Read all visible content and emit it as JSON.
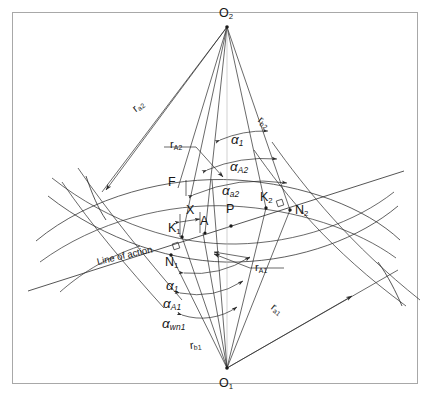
{
  "figure": {
    "type": "engineering-diagram",
    "background_color": "#ffffff",
    "line_color": "#2a2a2a",
    "border_color": "#a8a8a8"
  },
  "centers": {
    "upper": {
      "label": "O",
      "sub": "2",
      "x": 227,
      "y": 24
    },
    "lower": {
      "label": "O",
      "sub": "1",
      "x": 227,
      "y": 371
    }
  },
  "points": [
    {
      "name": "K1",
      "label": "K",
      "sub": "1",
      "x": 182,
      "y": 235
    },
    {
      "name": "A",
      "label": "A",
      "sub": "",
      "x": 203,
      "y": 231
    },
    {
      "name": "P",
      "label": "P",
      "sub": "",
      "x": 229,
      "y": 221
    },
    {
      "name": "K2",
      "label": "K",
      "sub": "2",
      "x": 266,
      "y": 207
    },
    {
      "name": "N1",
      "label": "N",
      "sub": "1",
      "x": 171,
      "y": 253
    },
    {
      "name": "N2",
      "label": "N",
      "sub": "2",
      "x": 290,
      "y": 210
    },
    {
      "name": "F",
      "label": "F",
      "sub": "",
      "x": 178,
      "y": 184
    },
    {
      "name": "X",
      "label": "X",
      "sub": "",
      "x": 188,
      "y": 217
    }
  ],
  "angles_upper": [
    {
      "name": "alpha-1-upper",
      "glyph": "α",
      "sub": "1",
      "x": 231,
      "y": 133
    },
    {
      "name": "alpha-A2",
      "glyph": "α",
      "sub": "A2",
      "x": 230,
      "y": 160
    },
    {
      "name": "alpha-a2",
      "glyph": "α",
      "sub": "a2",
      "x": 222,
      "y": 184
    }
  ],
  "angles_lower": [
    {
      "name": "alpha-1-lower",
      "glyph": "α",
      "sub": "1",
      "x": 166,
      "y": 279
    },
    {
      "name": "alpha-A1",
      "glyph": "α",
      "sub": "A1",
      "x": 163,
      "y": 297
    },
    {
      "name": "alpha-wn1",
      "glyph": "α",
      "sub": "wn1",
      "x": 162,
      "y": 317
    }
  ],
  "radii": [
    {
      "name": "r-a2",
      "glyph": "r",
      "sub": "a2",
      "x": 134,
      "y": 104,
      "rotate": -38
    },
    {
      "name": "r-A2",
      "glyph": "r",
      "sub": "A2",
      "x": 170,
      "y": 139,
      "rotate": 0
    },
    {
      "name": "r-b2",
      "glyph": "r",
      "sub": "b2",
      "x": 259,
      "y": 113,
      "rotate": 40
    },
    {
      "name": "r-A1",
      "glyph": "r",
      "sub": "A1",
      "x": 255,
      "y": 262,
      "rotate": 0
    },
    {
      "name": "r-a1",
      "glyph": "r",
      "sub": "a1",
      "x": 272,
      "y": 300,
      "rotate": 38
    },
    {
      "name": "r-b1",
      "glyph": "r",
      "sub": "b1",
      "x": 190,
      "y": 340,
      "rotate": -6
    }
  ],
  "annotations": [
    {
      "name": "line-of-action",
      "text": "Line of action",
      "x": 97,
      "y": 257,
      "rotate": -13
    }
  ],
  "chart_data": {
    "type": "diagram",
    "title": "",
    "geometry": {
      "O2": [
        227,
        24
      ],
      "O1": [
        227,
        371
      ],
      "pitch_point_P": [
        229,
        221
      ],
      "line_of_action_endpoints": [
        [
          30,
          290
        ],
        [
          400,
          172
        ]
      ],
      "contact_points": {
        "N1": [
          171,
          253
        ],
        "K1": [
          182,
          235
        ],
        "A": [
          203,
          231
        ],
        "P": [
          229,
          221
        ],
        "K2": [
          266,
          207
        ],
        "N2": [
          290,
          210
        ]
      }
    }
  }
}
